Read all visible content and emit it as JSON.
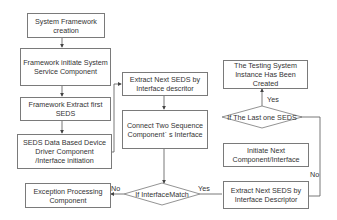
{
  "diagram": {
    "type": "flowchart",
    "nodes": {
      "n1": {
        "label": "System Framework creation",
        "shape": "rect"
      },
      "n2": {
        "label": "Framework initiate System Service Component",
        "shape": "rect"
      },
      "n3": {
        "label": "Framework Extract first  SEDS",
        "shape": "rect"
      },
      "n4": {
        "label": "SEDS Data Based Device Driver Component /Interface initiation",
        "shape": "rect"
      },
      "n5": {
        "label": "Exception Processing Component",
        "shape": "rect"
      },
      "n6": {
        "label": "Extract Next SEDS by Interface descritor",
        "shape": "rect"
      },
      "n7": {
        "label": "Connect Two Sequence Componentˊ s Interface",
        "shape": "rect"
      },
      "d1": {
        "label": "If InterfaceMatch",
        "shape": "diamond"
      },
      "n8": {
        "label": "Extract Next SEDS by Interface Descriptor",
        "shape": "rect"
      },
      "n9": {
        "label": "Initiate Next Component/Interface",
        "shape": "rect"
      },
      "d2": {
        "label": "If The Last one SEDS",
        "shape": "diamond"
      },
      "n10": {
        "label": "The Testing System Instance Has Been Created",
        "shape": "rect"
      }
    },
    "edges": [
      {
        "from": "n1",
        "to": "n2",
        "label": ""
      },
      {
        "from": "n2",
        "to": "n3",
        "label": ""
      },
      {
        "from": "n3",
        "to": "n4",
        "label": ""
      },
      {
        "from": "n4",
        "to": "n6",
        "label": ""
      },
      {
        "from": "n6",
        "to": "n7",
        "label": ""
      },
      {
        "from": "n7",
        "to": "d1",
        "label": ""
      },
      {
        "from": "d1",
        "to": "n5",
        "label": "No"
      },
      {
        "from": "d1",
        "to": "n8",
        "label": "Yes"
      },
      {
        "from": "n9",
        "to": "d2",
        "label": ""
      },
      {
        "from": "d2",
        "to": "n10",
        "label": "Yes"
      },
      {
        "from": "d2",
        "to": "n8",
        "label": "No"
      }
    ],
    "edge_labels": {
      "d1_no": "No",
      "d1_yes": "Yes",
      "d2_yes": "Yes",
      "d2_no": "No"
    }
  }
}
